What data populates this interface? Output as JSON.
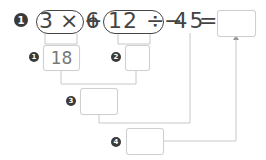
{
  "problem": {
    "number": "1",
    "expression": {
      "group1": "3 × 6",
      "plus": "+",
      "group2": "12 ÷ 4",
      "minus_five": "− 5",
      "equals": "="
    },
    "answer": ""
  },
  "steps": [
    {
      "number": "1",
      "value": "18"
    },
    {
      "number": "2",
      "value": ""
    },
    {
      "number": "3",
      "value": ""
    },
    {
      "number": "4",
      "value": ""
    }
  ],
  "colors": {
    "text": "#444444",
    "badge": "#3a3a3a",
    "box_border": "#cfcfcf",
    "line": "#c8c8c8"
  }
}
